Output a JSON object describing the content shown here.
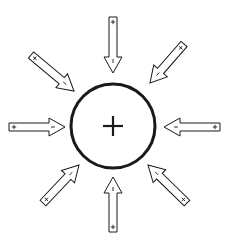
{
  "diagram": {
    "colors": {
      "stroke": "#1a1a1a",
      "fill": "#ffffff",
      "background": "#ffffff"
    },
    "center": {
      "x": 113,
      "y": 126,
      "radius": 42,
      "label": "+"
    },
    "arrows": [
      {
        "id": "top",
        "tail": [
          113,
          17
        ],
        "tip": [
          113,
          73
        ],
        "tail_sign": "+",
        "head_sign": "-"
      },
      {
        "id": "top-right",
        "tail": [
          184,
          44
        ],
        "tip": [
          150,
          83
        ],
        "tail_sign": "+",
        "head_sign": "-"
      },
      {
        "id": "right",
        "tail": [
          220,
          127
        ],
        "tip": [
          164,
          127
        ],
        "tail_sign": "+",
        "head_sign": "-"
      },
      {
        "id": "bottom-right",
        "tail": [
          187,
          203
        ],
        "tip": [
          148,
          165
        ],
        "tail_sign": "+",
        "head_sign": "-"
      },
      {
        "id": "bottom",
        "tail": [
          113,
          232
        ],
        "tip": [
          113,
          177
        ],
        "tail_sign": "+",
        "head_sign": "-"
      },
      {
        "id": "bottom-left",
        "tail": [
          43,
          203
        ],
        "tip": [
          79,
          165
        ],
        "tail_sign": "+",
        "head_sign": "-"
      },
      {
        "id": "left",
        "tail": [
          9,
          127
        ],
        "tip": [
          65,
          127
        ],
        "tail_sign": "+",
        "head_sign": "-"
      },
      {
        "id": "top-left",
        "tail": [
          31,
          55
        ],
        "tip": [
          74,
          91
        ],
        "tail_sign": "+",
        "head_sign": "-"
      }
    ]
  }
}
